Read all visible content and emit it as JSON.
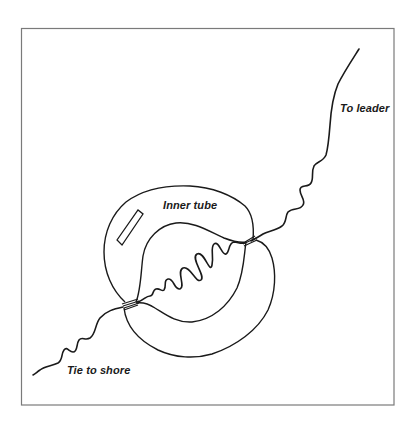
{
  "figure": {
    "labels": {
      "to_leader": "To leader",
      "inner_tube": "Inner tube",
      "tie_to_shore": "Tie to shore"
    },
    "colors": {
      "line": "#1a1a1a",
      "frame": "#7a7a7a",
      "background": "#ffffff"
    },
    "frame": {
      "left": 21,
      "top": 28,
      "right": 394,
      "bottom": 405
    }
  }
}
